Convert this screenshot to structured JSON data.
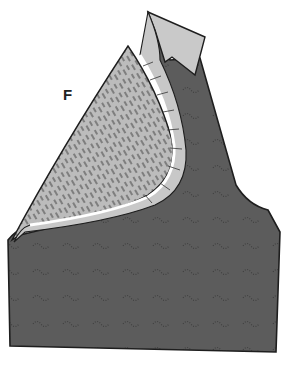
{
  "figure": {
    "label": "F",
    "colors": {
      "fabric_dark": "#5c5c5c",
      "lining_light": "#bdbdbd",
      "facing_light": "#c8c8c8",
      "seam_white": "#ffffff",
      "outline": "#1e1e1e"
    }
  }
}
